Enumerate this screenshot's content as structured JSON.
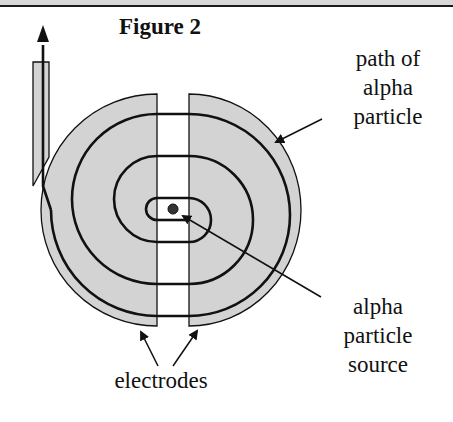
{
  "figure": {
    "title": "Figure 2"
  },
  "labels": {
    "path": [
      "path of",
      "alpha",
      "particle"
    ],
    "source": [
      "alpha",
      "particle",
      "source"
    ],
    "electrodes": "electrodes"
  },
  "colors": {
    "electrode_fill": "#d3d3d3",
    "line": "#111111",
    "background": "#ffffff"
  }
}
